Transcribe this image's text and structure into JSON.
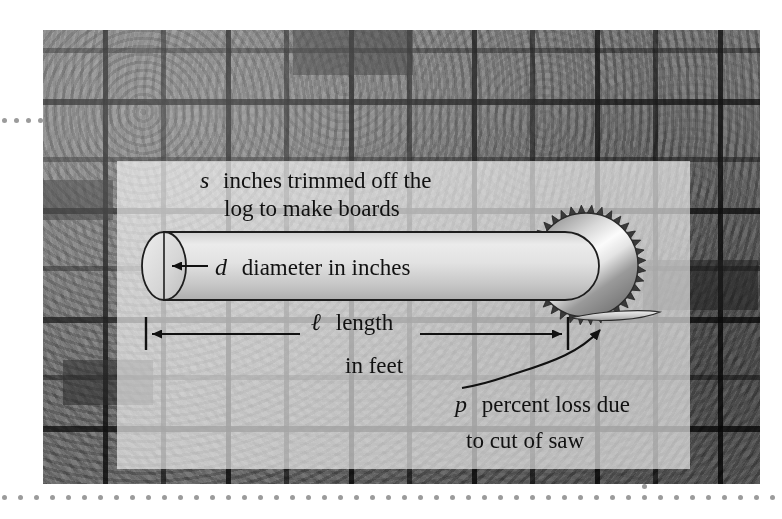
{
  "figure": {
    "background_photo": "stacked-lumber-end-grain-photograph",
    "labels": {
      "trim_line1_var": "s",
      "trim_line1_text": "inches trimmed off the",
      "trim_line2_text": "log to make boards",
      "diameter_var": "d",
      "diameter_text": "diameter in inches",
      "length_var": "ℓ",
      "length_line1_text": "length",
      "length_line2_text": "in feet",
      "loss_var": "p",
      "loss_line1_text": "percent loss due",
      "loss_line2_text": "to cut of saw"
    },
    "shapes": {
      "log": "cylinder-log",
      "log_end": "ellipse-log-end-face",
      "diameter_line": "vertical-diameter-line",
      "saw": "circular-saw-blade",
      "saw_teeth_count": 36,
      "sliver": "cut-off-sliver-shape",
      "length_dimension": "double-headed-dimension-arrow",
      "loss_pointer": "curved-arrow"
    },
    "colors": {
      "ink": "#111111",
      "log_fill_light": "#e8e8e8",
      "log_fill_dark": "#b9b9b9",
      "saw_light": "#f2f2f2",
      "saw_dark": "#6f6f6f",
      "overlay_white": "rgba(255,255,255,0.62)",
      "dot_gray": "#9b9b9b",
      "page_background": "#ffffff"
    }
  }
}
